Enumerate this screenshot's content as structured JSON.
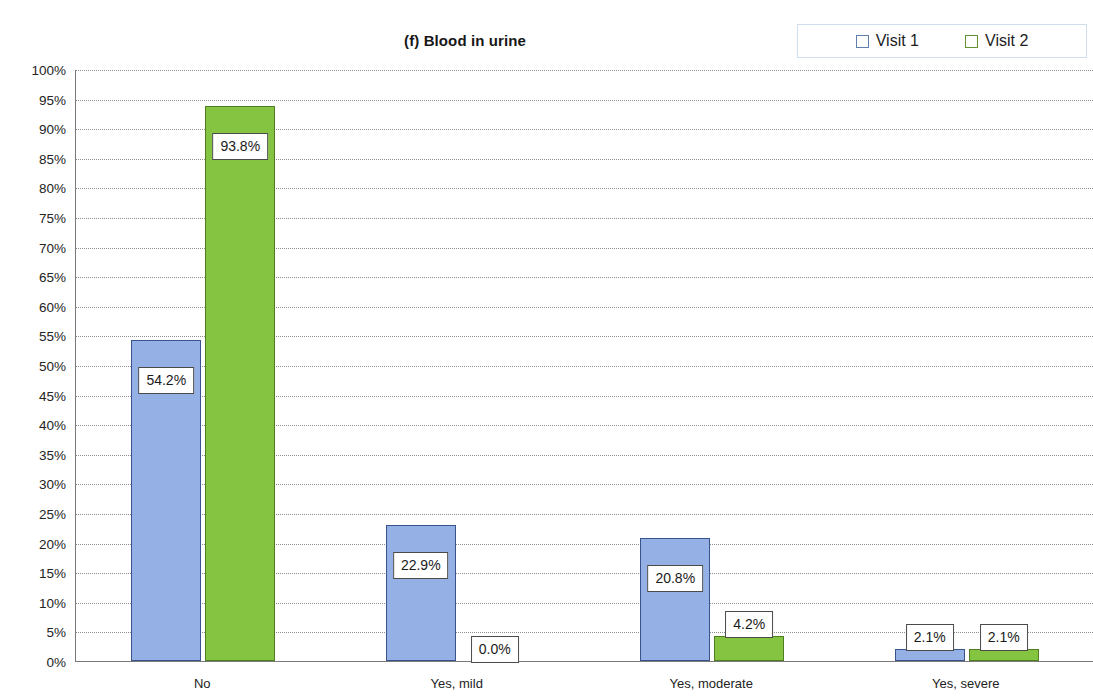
{
  "chart_data": {
    "type": "bar",
    "title": "(f) Blood in urine",
    "xlabel": "",
    "ylabel": "",
    "ylim": [
      0,
      100
    ],
    "ytick_labels": [
      "100%",
      "95%",
      "90%",
      "85%",
      "80%",
      "75%",
      "70%",
      "65%",
      "60%",
      "55%",
      "50%",
      "45%",
      "40%",
      "35%",
      "30%",
      "25%",
      "20%",
      "15%",
      "10%",
      "5%",
      "0%"
    ],
    "ytick_values": [
      100,
      95,
      90,
      85,
      80,
      75,
      70,
      65,
      60,
      55,
      50,
      45,
      40,
      35,
      30,
      25,
      20,
      15,
      10,
      5,
      0
    ],
    "grid": true,
    "legend_position": "top-right",
    "categories": [
      "No",
      "Yes, mild",
      "Yes, moderate",
      "Yes, severe"
    ],
    "series": [
      {
        "name": "Visit 1",
        "color": "#95b0e4",
        "border_color": "#39538c",
        "values": [
          54.2,
          22.9,
          20.8,
          2.1
        ],
        "labels": [
          "54.2%",
          "22.9%",
          "20.8%",
          "2.1%"
        ]
      },
      {
        "name": "Visit 2",
        "color": "#85c440",
        "border_color": "#4f7d22",
        "values": [
          93.8,
          0.0,
          4.2,
          2.1
        ],
        "labels": [
          "93.8%",
          "0.0%",
          "4.2%",
          "2.1%"
        ]
      }
    ]
  }
}
